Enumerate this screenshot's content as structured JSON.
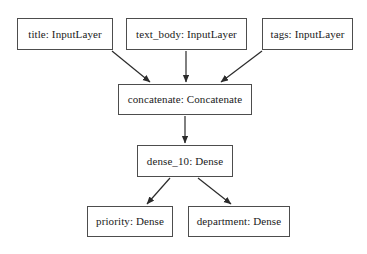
{
  "diagram": {
    "type": "keras-model-graph",
    "title": "",
    "background_color": "#ffffff",
    "node_border_color": "#4d4d4d",
    "node_fill_color": "#ffffff",
    "edge_color": "#2b2b2b",
    "text_color": "#1a1a1a",
    "nodes": [
      {
        "id": "title",
        "label": "title: InputLayer",
        "layer_name": "title",
        "layer_type": "InputLayer",
        "x": 17,
        "y": 18,
        "w": 96,
        "h": 32
      },
      {
        "id": "text_body",
        "label": "text_body: InputLayer",
        "layer_name": "text_body",
        "layer_type": "InputLayer",
        "x": 126,
        "y": 18,
        "w": 121,
        "h": 32
      },
      {
        "id": "tags",
        "label": "tags: InputLayer",
        "layer_name": "tags",
        "layer_type": "InputLayer",
        "x": 262,
        "y": 18,
        "w": 91,
        "h": 32
      },
      {
        "id": "concatenate",
        "label": "concatenate: Concatenate",
        "layer_name": "concatenate",
        "layer_type": "Concatenate",
        "x": 118,
        "y": 84,
        "w": 134,
        "h": 31
      },
      {
        "id": "dense_10",
        "label": "dense_10: Dense",
        "layer_name": "dense_10",
        "layer_type": "Dense",
        "x": 137,
        "y": 145,
        "w": 96,
        "h": 32
      },
      {
        "id": "priority",
        "label": "priority: Dense",
        "layer_name": "priority",
        "layer_type": "Dense",
        "x": 87,
        "y": 206,
        "w": 86,
        "h": 31
      },
      {
        "id": "department",
        "label": "department: Dense",
        "layer_name": "department",
        "layer_type": "Dense",
        "x": 188,
        "y": 206,
        "w": 102,
        "h": 31
      }
    ],
    "edges": [
      {
        "id": "title-to-concatenate",
        "from": "title",
        "to": "concatenate",
        "x1": 112,
        "y1": 51,
        "x2": 150,
        "y2": 82
      },
      {
        "id": "text_body-to-concatenate",
        "from": "text_body",
        "to": "concatenate",
        "x1": 186,
        "y1": 51,
        "x2": 186,
        "y2": 82
      },
      {
        "id": "tags-to-concatenate",
        "from": "tags",
        "to": "concatenate",
        "x1": 262,
        "y1": 51,
        "x2": 221,
        "y2": 82
      },
      {
        "id": "concatenate-to-dense_10",
        "from": "concatenate",
        "to": "dense_10",
        "x1": 185,
        "y1": 116,
        "x2": 185,
        "y2": 143
      },
      {
        "id": "dense_10-to-priority",
        "from": "dense_10",
        "to": "priority",
        "x1": 170,
        "y1": 178,
        "x2": 147,
        "y2": 204
      },
      {
        "id": "dense_10-to-department",
        "from": "dense_10",
        "to": "department",
        "x1": 198,
        "y1": 178,
        "x2": 231,
        "y2": 204
      }
    ]
  }
}
